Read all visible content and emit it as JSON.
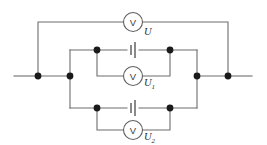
{
  "diagram": {
    "type": "electrical-circuit-schematic",
    "background_color": "#ffffff",
    "wire_color": "#6d6d6d",
    "node_color": "#1a1a1a",
    "label_color": "#2b2b2b",
    "meters": [
      {
        "id": "total",
        "glyph": "V",
        "label_main": "U",
        "label_sub": "",
        "cx": 133,
        "cy": 22,
        "r": 9.5,
        "label_x": 144,
        "label_y": 33
      },
      {
        "id": "cell1",
        "glyph": "V",
        "label_main": "U",
        "label_sub": "1",
        "cx": 133,
        "cy": 76,
        "r": 9.5,
        "label_x": 144,
        "label_y": 84
      },
      {
        "id": "cell2",
        "glyph": "V",
        "label_main": "U",
        "label_sub": "2",
        "cx": 133,
        "cy": 130,
        "r": 9.5,
        "label_x": 144,
        "label_y": 138
      }
    ],
    "cells": [
      {
        "id": "cell-upper",
        "x": 133,
        "y": 50,
        "short_plate_half_height": 5,
        "long_plate_half_height": 8,
        "gap": 4
      },
      {
        "id": "cell-lower",
        "x": 133,
        "y": 108,
        "short_plate_half_height": 5,
        "long_plate_half_height": 8,
        "gap": 4
      }
    ],
    "nodes": [
      {
        "id": "left-outer-rail",
        "cx": 38,
        "cy": 76,
        "r": 3.4
      },
      {
        "id": "left-inner-rail",
        "cx": 70,
        "cy": 76,
        "r": 3.4
      },
      {
        "id": "right-inner-rail",
        "cx": 197,
        "cy": 76,
        "r": 3.4
      },
      {
        "id": "right-outer-rail",
        "cx": 228,
        "cy": 76,
        "r": 3.4
      },
      {
        "id": "upper-branch-left",
        "cx": 97,
        "cy": 50,
        "r": 3.4
      },
      {
        "id": "upper-branch-right",
        "cx": 170,
        "cy": 50,
        "r": 3.4
      },
      {
        "id": "lower-branch-left",
        "cx": 97,
        "cy": 108,
        "r": 3.4
      },
      {
        "id": "lower-branch-right",
        "cx": 170,
        "cy": 108,
        "r": 3.4
      }
    ],
    "wires": [
      {
        "id": "rail-left-stub",
        "d": "M 14 76 L 38 76"
      },
      {
        "id": "rail-left-segment",
        "d": "M 38 76 L 70 76"
      },
      {
        "id": "rail-right-segment",
        "d": "M 197 76 L 228 76"
      },
      {
        "id": "rail-right-stub",
        "d": "M 228 76 L 252 76"
      },
      {
        "id": "outer-loop-left",
        "d": "M 38 76 L 38 22 L 123.5 22"
      },
      {
        "id": "outer-loop-right",
        "d": "M 142.5 22 L 228 22 L 228 76"
      },
      {
        "id": "inner-box-left",
        "d": "M 70 50 L 70 108"
      },
      {
        "id": "inner-box-right",
        "d": "M 197 50 L 197 108"
      },
      {
        "id": "upper-rail-left",
        "d": "M 70 50 L 127 50"
      },
      {
        "id": "upper-rail-right",
        "d": "M 139 50 L 197 50"
      },
      {
        "id": "lower-rail-left",
        "d": "M 70 108 L 127 108"
      },
      {
        "id": "lower-rail-right",
        "d": "M 139 108 L 197 108"
      },
      {
        "id": "upper-meter-loop",
        "d": "M 97 50 L 97 76 L 123.5 76"
      },
      {
        "id": "upper-meter-loop-r",
        "d": "M 142.5 76 L 170 76 L 170 50"
      },
      {
        "id": "lower-meter-loop",
        "d": "M 97 108 L 97 130 L 123.5 130"
      },
      {
        "id": "lower-meter-loop-r",
        "d": "M 142.5 130 L 170 130 L 170 108"
      }
    ]
  }
}
